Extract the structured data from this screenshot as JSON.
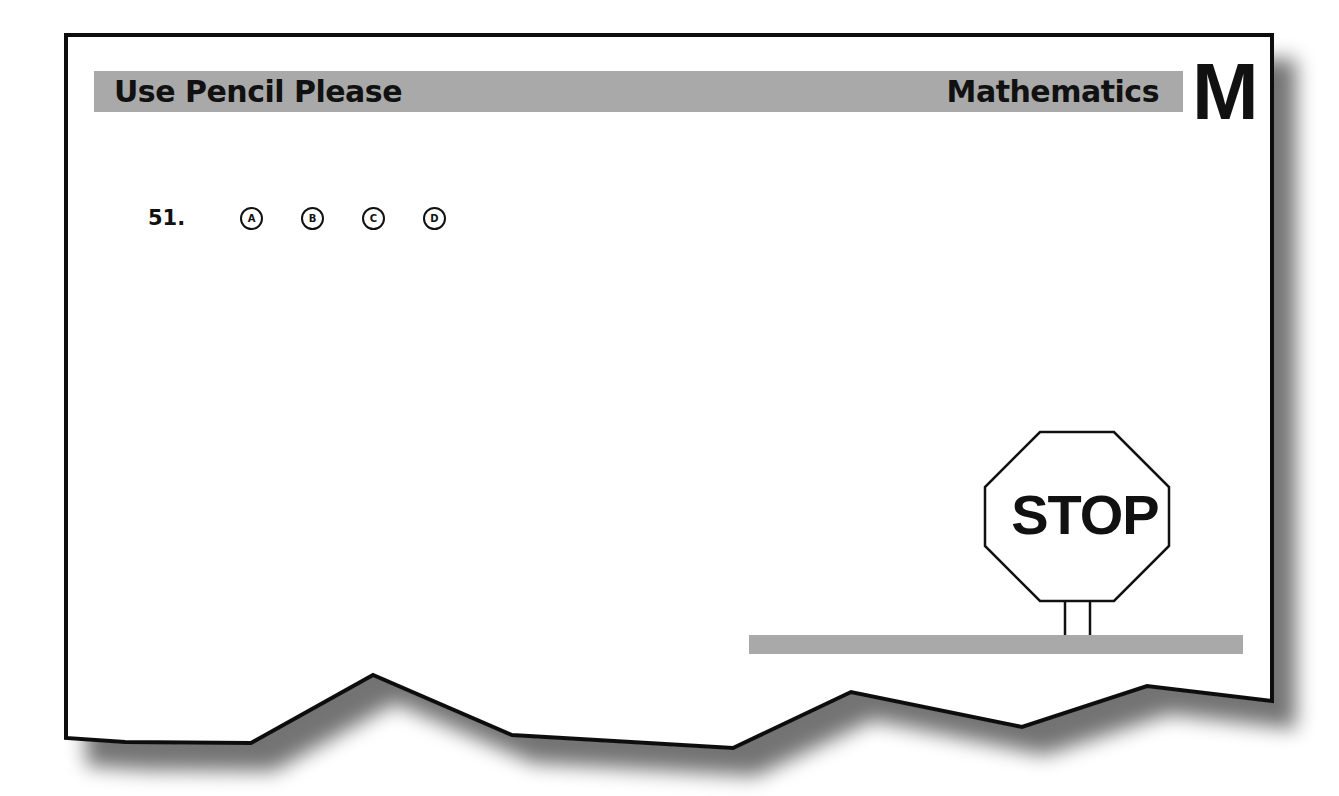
{
  "header": {
    "left_label": "Use Pencil Please",
    "subject": "Mathematics",
    "section_letter": "M"
  },
  "question": {
    "number": "51.",
    "options": [
      "A",
      "B",
      "C",
      "D"
    ]
  },
  "stop_sign": {
    "label": "STOP"
  },
  "colors": {
    "bar_gray": "#a9a9a9",
    "ink": "#111111",
    "paper": "#ffffff"
  }
}
